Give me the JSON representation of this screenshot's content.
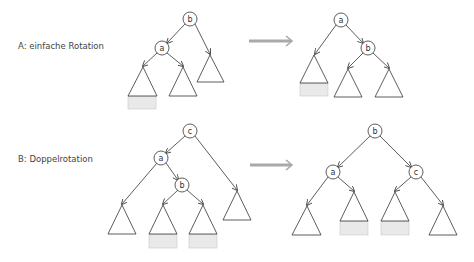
{
  "sections": [
    {
      "label": "A: einfache Rotation",
      "before": {
        "nodes": [
          "b",
          "a"
        ]
      },
      "after": {
        "nodes": [
          "a",
          "b"
        ]
      }
    },
    {
      "label": "B: Doppelrotation",
      "before": {
        "nodes": [
          "c",
          "a",
          "b"
        ]
      },
      "after": {
        "nodes": [
          "b",
          "a",
          "c"
        ]
      }
    }
  ],
  "colors": {
    "line": "#333333",
    "highlight_box": "#e9e9e9",
    "arrow": "#a9a9a9"
  }
}
